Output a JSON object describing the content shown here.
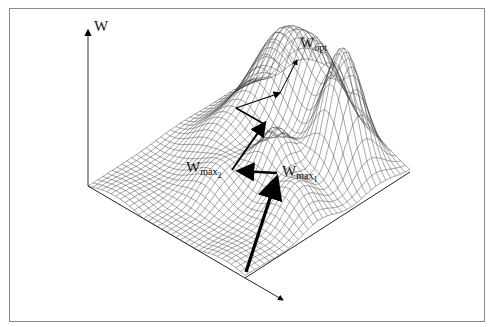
{
  "figure": {
    "type": "3d-wireframe-fitness-landscape",
    "axis_label": "W",
    "labels": {
      "w_opt": {
        "main": "W",
        "sub": "opt"
      },
      "w_max1": {
        "main": "W",
        "sub": "max",
        "subsub": "1"
      },
      "w_max2": {
        "main": "W",
        "sub": "max",
        "subsub": "2"
      }
    },
    "colors": {
      "mesh": "#333333",
      "arrow": "#000000",
      "frame": "#8a8a8a",
      "background": "#ffffff"
    }
  }
}
